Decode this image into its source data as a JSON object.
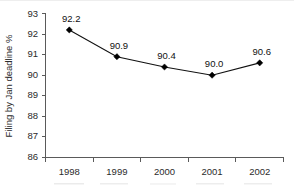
{
  "chart_data": {
    "type": "line",
    "title": "",
    "subtitle": "",
    "xlabel": "",
    "ylabel": "Filing by Jan deadline %",
    "categories": [
      "1998",
      "1999",
      "2000",
      "2001",
      "2002"
    ],
    "values": [
      92.2,
      90.9,
      90.4,
      90.0,
      90.6
    ],
    "point_labels": [
      "92.2",
      "90.9",
      "90.4",
      "90.0",
      "90.6"
    ],
    "ylim": [
      86,
      93
    ],
    "ytick_labels": [
      "93",
      "92",
      "91",
      "90",
      "89",
      "88",
      "87",
      "86"
    ],
    "ytick_values": [
      93,
      92,
      91,
      90,
      89,
      88,
      87,
      86
    ],
    "grid": false,
    "legend": false,
    "legend_position": "none",
    "marker_style": "diamond",
    "series": [
      {
        "name": "Filing by Jan deadline %",
        "values": [
          92.2,
          90.9,
          90.4,
          90.0,
          90.6
        ]
      }
    ],
    "colors": {
      "line": "#111111",
      "marker": "#000000",
      "axis": "#5a5a5a",
      "text": "#2b2b2b",
      "background": "#ffffff"
    }
  }
}
